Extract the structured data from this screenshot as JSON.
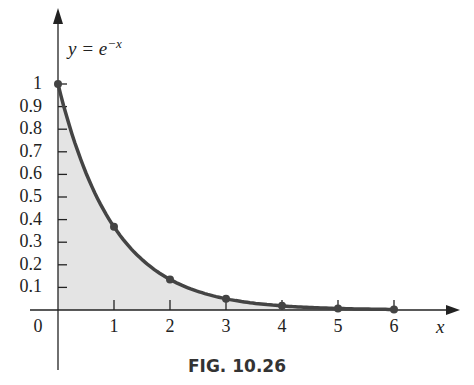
{
  "chart_data": {
    "type": "area",
    "equation": {
      "lhs": "y = e",
      "exp": "−x"
    },
    "xlabel": "x",
    "ylabel": "",
    "x_ticks": [
      "0",
      "1",
      "2",
      "3",
      "4",
      "5",
      "6"
    ],
    "y_ticks": [
      "0.1",
      "0.2",
      "0.3",
      "0.4",
      "0.5",
      "0.6",
      "0.7",
      "0.8",
      "0.9",
      "1"
    ],
    "xlim": [
      0,
      6.5
    ],
    "ylim": [
      0,
      1.3
    ],
    "grid": false,
    "points": [
      {
        "x": 0,
        "y": 1.0
      },
      {
        "x": 1,
        "y": 0.368
      },
      {
        "x": 2,
        "y": 0.135
      },
      {
        "x": 3,
        "y": 0.05
      },
      {
        "x": 4,
        "y": 0.018
      },
      {
        "x": 5,
        "y": 0.007
      },
      {
        "x": 6,
        "y": 0.002
      }
    ],
    "shaded": "area under curve",
    "caption": "FIG. 10.26"
  },
  "colors": {
    "curve": "#444444",
    "fill": "#e4e4e4",
    "axis": "#222222"
  }
}
